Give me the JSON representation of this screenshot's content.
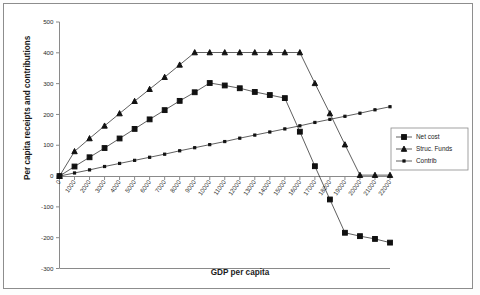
{
  "figure": {
    "background_color": "#ffffff",
    "frame_color": "#8d8d8d",
    "axis_color": "#8a8a8a",
    "ink_color": "#111111"
  },
  "chart_data": {
    "type": "line",
    "title": "",
    "xlabel": "GDP per capita",
    "ylabel": "Per capita receipts and contributions",
    "xlim": [
      0,
      22000
    ],
    "ylim": [
      -300,
      500
    ],
    "ytick_values": [
      -300,
      -200,
      -100,
      0,
      100,
      200,
      300,
      400,
      500
    ],
    "ytick_labels": [
      "-300",
      "-200",
      "-100",
      "0",
      "100",
      "200",
      "300",
      "400",
      "500"
    ],
    "grid": false,
    "legend_position": "right",
    "categories": [
      0,
      1000,
      2000,
      3000,
      4000,
      5000,
      6000,
      7000,
      8000,
      9000,
      10000,
      11000,
      12000,
      13000,
      14000,
      15000,
      16000,
      17000,
      18000,
      19000,
      20000,
      21000,
      22000
    ],
    "xtick_labels": [
      "0",
      "1000",
      "2000",
      "3000",
      "4000",
      "5000",
      "6000",
      "7000",
      "8000",
      "9000",
      "10000",
      "11000",
      "12000",
      "13000",
      "14000",
      "15000",
      "16000",
      "17000",
      "18000",
      "19000",
      "20000",
      "21000",
      "22000"
    ],
    "series": [
      {
        "name": "Net cost",
        "marker": "square",
        "values": [
          0,
          31,
          61,
          91,
          122,
          153,
          184,
          214,
          244,
          272,
          302,
          294,
          285,
          273,
          263,
          253,
          144,
          32,
          -76,
          -184,
          -195,
          -204,
          -216
        ]
      },
      {
        "name": "Struc. Funds",
        "marker": "triangle",
        "values": [
          0,
          80,
          122,
          163,
          203,
          243,
          282,
          321,
          361,
          401,
          401,
          401,
          401,
          401,
          401,
          401,
          401,
          301,
          203,
          102,
          3,
          3,
          3
        ]
      },
      {
        "name": "Contrib",
        "marker": "cross",
        "values": [
          0,
          10,
          20,
          31,
          41,
          51,
          61,
          71,
          82,
          92,
          102,
          112,
          123,
          133,
          143,
          153,
          163,
          174,
          184,
          194,
          204,
          215,
          225
        ]
      }
    ]
  },
  "legend": {
    "items": [
      {
        "label": "Net cost",
        "marker": "square"
      },
      {
        "label": "Struc. Funds",
        "marker": "triangle"
      },
      {
        "label": "Contrib",
        "marker": "cross"
      }
    ]
  }
}
